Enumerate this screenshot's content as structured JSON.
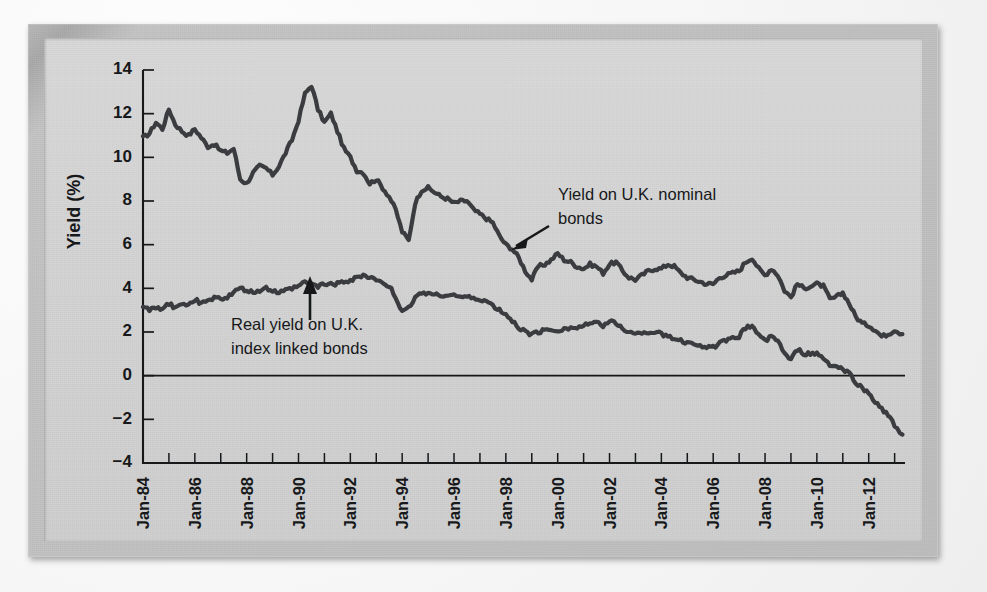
{
  "figure": {
    "background_color": "#d4d4d4",
    "frame_color": "#bdbdbd",
    "line_color": "#3a3c40",
    "axis_color": "#17181a"
  },
  "annotations": [
    {
      "id": "nominal",
      "line1": "Yield on U.K. nominal",
      "line2": "bonds",
      "arrow": "down-left-arrow"
    },
    {
      "id": "index-linked",
      "line1": "Real yield on U.K.",
      "line2": "index linked bonds",
      "arrow": "up-arrow"
    }
  ],
  "chart_data": {
    "type": "line",
    "title": "",
    "xlabel": "",
    "ylabel": "Yield (%)",
    "ylim": [
      -4,
      14
    ],
    "ytick_labels": [
      "14",
      "12",
      "10",
      "8",
      "6",
      "4",
      "2",
      "0",
      "-2",
      "-4"
    ],
    "ytick_values": [
      14,
      12,
      10,
      8,
      6,
      4,
      2,
      0,
      -2,
      -4
    ],
    "xlim": [
      1984,
      2013.4
    ],
    "xtick_labels": [
      "Jan-84",
      "Jan-86",
      "Jan-88",
      "Jan-90",
      "Jan-92",
      "Jan-94",
      "Jan-96",
      "Jan-98",
      "Jan-00",
      "Jan-02",
      "Jan-04",
      "Jan-06",
      "Jan-08",
      "Jan-10",
      "Jan-12"
    ],
    "xtick_values": [
      1984,
      1986,
      1988,
      1990,
      1992,
      1994,
      1996,
      1998,
      2000,
      2002,
      2004,
      2006,
      2008,
      2010,
      2012
    ],
    "xtick_minor_step": 1,
    "grid": false,
    "legend": "annotated-inline",
    "zero_line": true,
    "x": [
      1984.0,
      1984.25,
      1984.5,
      1984.75,
      1985.0,
      1985.25,
      1985.5,
      1985.75,
      1986.0,
      1986.25,
      1986.5,
      1986.75,
      1987.0,
      1987.25,
      1987.5,
      1987.75,
      1988.0,
      1988.25,
      1988.5,
      1988.75,
      1989.0,
      1989.25,
      1989.5,
      1989.75,
      1990.0,
      1990.25,
      1990.5,
      1990.75,
      1991.0,
      1991.25,
      1991.5,
      1991.75,
      1992.0,
      1992.25,
      1992.5,
      1992.75,
      1993.0,
      1993.25,
      1993.5,
      1993.75,
      1994.0,
      1994.25,
      1994.5,
      1994.75,
      1995.0,
      1995.25,
      1995.5,
      1995.75,
      1996.0,
      1996.25,
      1996.5,
      1996.75,
      1997.0,
      1997.25,
      1997.5,
      1997.75,
      1998.0,
      1998.25,
      1998.5,
      1998.75,
      1999.0,
      1999.25,
      1999.5,
      1999.75,
      2000.0,
      2000.25,
      2000.5,
      2000.75,
      2001.0,
      2001.25,
      2001.5,
      2001.75,
      2002.0,
      2002.25,
      2002.5,
      2002.75,
      2003.0,
      2003.25,
      2003.5,
      2003.75,
      2004.0,
      2004.25,
      2004.5,
      2004.75,
      2005.0,
      2005.25,
      2005.5,
      2005.75,
      2006.0,
      2006.25,
      2006.5,
      2006.75,
      2007.0,
      2007.25,
      2007.5,
      2007.75,
      2008.0,
      2008.25,
      2008.5,
      2008.75,
      2009.0,
      2009.25,
      2009.5,
      2009.75,
      2010.0,
      2010.25,
      2010.5,
      2010.75,
      2011.0,
      2011.25,
      2011.5,
      2011.75,
      2012.0,
      2012.25,
      2012.5,
      2012.75,
      2013.0,
      2013.3
    ],
    "series": [
      {
        "name": "Yield on U.K. nominal bonds",
        "color": "#3a3c40",
        "values": [
          10.9,
          11.1,
          11.6,
          11.3,
          12.2,
          11.5,
          11.2,
          11.0,
          11.3,
          10.9,
          10.5,
          10.6,
          10.3,
          10.2,
          10.4,
          9.0,
          8.8,
          9.3,
          9.6,
          9.5,
          9.2,
          9.6,
          10.2,
          10.8,
          11.7,
          12.9,
          13.3,
          12.2,
          11.6,
          12.0,
          11.2,
          10.4,
          10.0,
          9.4,
          9.3,
          8.8,
          9.0,
          8.6,
          8.2,
          7.6,
          6.6,
          6.2,
          7.9,
          8.5,
          8.6,
          8.4,
          8.2,
          8.1,
          7.9,
          8.0,
          8.0,
          7.6,
          7.4,
          7.2,
          7.0,
          6.4,
          6.0,
          5.8,
          5.4,
          4.8,
          4.4,
          5.0,
          5.1,
          5.3,
          5.6,
          5.3,
          5.2,
          5.0,
          4.9,
          5.1,
          5.0,
          4.7,
          5.1,
          5.2,
          4.8,
          4.5,
          4.4,
          4.6,
          4.8,
          4.9,
          4.9,
          5.1,
          5.0,
          4.7,
          4.5,
          4.4,
          4.3,
          4.2,
          4.2,
          4.5,
          4.6,
          4.7,
          4.8,
          5.2,
          5.4,
          4.9,
          4.6,
          4.9,
          4.6,
          3.9,
          3.6,
          4.2,
          4.0,
          4.1,
          4.2,
          4.1,
          3.5,
          3.6,
          3.8,
          3.3,
          2.7,
          2.4,
          2.3,
          2.1,
          1.8,
          1.9,
          2.1,
          1.9
        ]
      },
      {
        "name": "Real yield on U.K. index linked bonds",
        "color": "#3a3c40",
        "values": [
          3.2,
          3.0,
          3.1,
          3.0,
          3.3,
          3.1,
          3.2,
          3.3,
          3.5,
          3.3,
          3.4,
          3.6,
          3.5,
          3.6,
          3.8,
          4.0,
          3.9,
          3.8,
          3.9,
          4.0,
          3.9,
          3.8,
          3.9,
          4.0,
          4.1,
          4.3,
          4.2,
          4.1,
          4.2,
          4.2,
          4.2,
          4.3,
          4.3,
          4.5,
          4.6,
          4.5,
          4.4,
          4.2,
          4.1,
          3.6,
          2.9,
          3.1,
          3.6,
          3.8,
          3.8,
          3.7,
          3.7,
          3.7,
          3.7,
          3.6,
          3.6,
          3.5,
          3.5,
          3.4,
          3.2,
          3.0,
          2.8,
          2.5,
          2.2,
          2.0,
          1.9,
          2.0,
          2.1,
          2.1,
          2.1,
          2.1,
          2.2,
          2.2,
          2.3,
          2.4,
          2.4,
          2.3,
          2.5,
          2.4,
          2.2,
          2.0,
          1.9,
          2.0,
          2.0,
          2.0,
          1.9,
          1.8,
          1.7,
          1.6,
          1.5,
          1.5,
          1.4,
          1.3,
          1.3,
          1.5,
          1.6,
          1.7,
          1.8,
          2.2,
          2.3,
          1.9,
          1.6,
          1.8,
          1.6,
          1.0,
          0.7,
          1.2,
          1.0,
          1.0,
          1.0,
          0.8,
          0.5,
          0.4,
          0.3,
          0.1,
          -0.3,
          -0.6,
          -0.8,
          -1.2,
          -1.5,
          -1.8,
          -2.3,
          -2.7
        ]
      }
    ]
  }
}
